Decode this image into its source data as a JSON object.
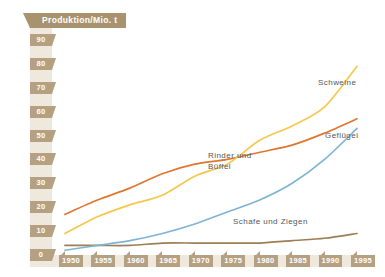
{
  "chart_data": {
    "type": "line",
    "title": "Produktion/Mio. t",
    "xlabel": "",
    "ylabel": "Produktion/Mio. t",
    "xlim": [
      1948,
      1997
    ],
    "ylim": [
      0,
      95
    ],
    "grid": false,
    "legend_position": "inline-right",
    "x": [
      1950,
      1955,
      1960,
      1965,
      1970,
      1975,
      1980,
      1985,
      1990,
      1995
    ],
    "xticks": [
      "1950",
      "1955",
      "1960",
      "1965",
      "1970",
      "1975",
      "1980",
      "1985",
      "1990",
      "1995"
    ],
    "yticks": [
      "0",
      "10",
      "20",
      "30",
      "40",
      "50",
      "60",
      "70",
      "80",
      "90"
    ],
    "series": [
      {
        "name": "Schweine",
        "color": "#f5c84b",
        "values": [
          9,
          16,
          21,
          25,
          33,
          38,
          48,
          54,
          62,
          79
        ]
      },
      {
        "name": "Rinder und Büffel",
        "color": "#e0762f",
        "values": [
          17,
          23,
          28,
          34,
          38,
          40,
          43,
          46,
          51,
          57
        ]
      },
      {
        "name": "Geflügel",
        "color": "#7fb4d4",
        "values": [
          2,
          4,
          6,
          9,
          13,
          18,
          23,
          30,
          40,
          53
        ]
      },
      {
        "name": "Schafe und Ziegen",
        "color": "#9c7f55",
        "values": [
          4,
          4,
          4,
          5,
          5,
          5,
          5,
          6,
          7,
          9
        ]
      }
    ],
    "annotations": [
      {
        "text": "Schweine",
        "x": 1989,
        "y": 69
      },
      {
        "text": "Geflügel",
        "x": 1989,
        "y": 45
      },
      {
        "text": "Rinder und",
        "x": 1973,
        "y": 35
      },
      {
        "text": "Büffel",
        "x": 1973,
        "y": 31
      },
      {
        "text": "Schafe und Ziegen",
        "x": 1979,
        "y": 12
      }
    ]
  },
  "axis": {
    "title_banner": "Produktion/Mio. t",
    "y_labels": [
      "90",
      "80",
      "70",
      "60",
      "50",
      "40",
      "30",
      "20",
      "10",
      "0"
    ],
    "x_labels": [
      "1950",
      "1955",
      "1960",
      "1965",
      "1970",
      "1975",
      "1980",
      "1985",
      "1990",
      "1995"
    ]
  },
  "labels": {
    "schweine": "Schweine",
    "gefluegel": "Geflügel",
    "rinder_line1": "Rinder und",
    "rinder_line2": "Büffel",
    "schafe": "Schafe und Ziegen"
  },
  "colors": {
    "schweine": "#f5c84b",
    "rinder": "#e0762f",
    "gefluegel": "#7fb4d4",
    "schafe": "#9c7f55",
    "banner": "#a9936e",
    "tick_chip": "#b5a182",
    "rail": "#efe9dd",
    "background": "#ffffff",
    "label_text": "#55565a"
  }
}
